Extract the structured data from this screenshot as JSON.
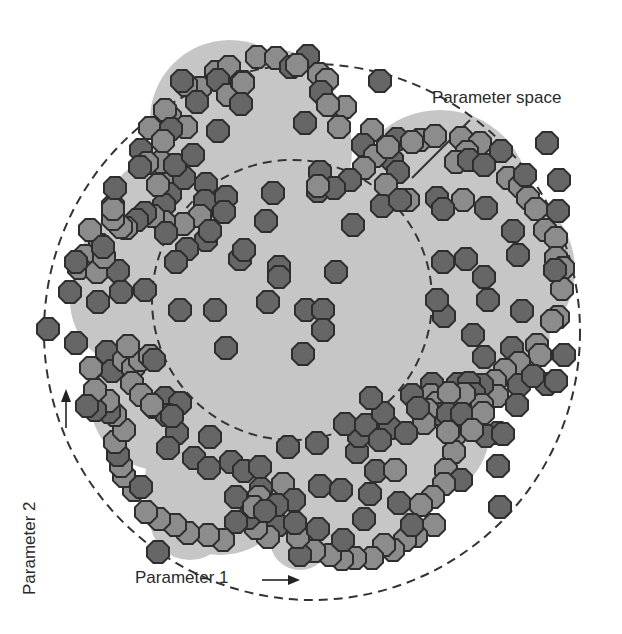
{
  "labels": {
    "parameter_space": "Parameter space",
    "parameter_1": "Parameter 1",
    "parameter_2": "Parameter 2"
  },
  "colors": {
    "background": "#ffffff",
    "region_fill": "#c6c6c6",
    "dot_dark": "#666666",
    "dot_light": "#8c8c8c",
    "dot_stroke": "#2e2e2e",
    "dashed_line": "#333333"
  },
  "outer_circle": {
    "cx": 312,
    "cy": 332,
    "r": 268
  },
  "inner_circle": {
    "cx": 292,
    "cy": 300,
    "r": 140
  },
  "region_lobes": [
    [
      252,
      150,
      100
    ],
    [
      440,
      200,
      90
    ],
    [
      490,
      270,
      85
    ],
    [
      470,
      330,
      80
    ],
    [
      180,
      230,
      80
    ],
    [
      140,
      300,
      70
    ],
    [
      160,
      400,
      70
    ],
    [
      220,
      480,
      75
    ],
    [
      330,
      470,
      90
    ],
    [
      420,
      430,
      70
    ],
    [
      292,
      300,
      145
    ],
    [
      230,
      120,
      80
    ],
    [
      280,
      95,
      45
    ],
    [
      350,
      440,
      80
    ],
    [
      120,
      270,
      45
    ],
    [
      190,
      520,
      40
    ],
    [
      300,
      540,
      30
    ],
    [
      380,
      520,
      35
    ]
  ],
  "dots": [
    {
      "x": 216,
      "y": 72,
      "t": "l"
    },
    {
      "x": 229,
      "y": 67,
      "t": "l"
    },
    {
      "x": 257,
      "y": 57,
      "t": "l"
    },
    {
      "x": 276,
      "y": 58,
      "t": "l"
    },
    {
      "x": 291,
      "y": 67,
      "t": "d"
    },
    {
      "x": 308,
      "y": 56,
      "t": "d"
    },
    {
      "x": 297,
      "y": 65,
      "t": "l"
    },
    {
      "x": 319,
      "y": 74,
      "t": "l"
    },
    {
      "x": 327,
      "y": 80,
      "t": "l"
    },
    {
      "x": 200,
      "y": 88,
      "t": "l"
    },
    {
      "x": 218,
      "y": 80,
      "t": "d"
    },
    {
      "x": 228,
      "y": 95,
      "t": "l"
    },
    {
      "x": 243,
      "y": 82,
      "t": "l"
    },
    {
      "x": 186,
      "y": 85,
      "t": "l"
    },
    {
      "x": 197,
      "y": 102,
      "t": "d"
    },
    {
      "x": 242,
      "y": 82,
      "t": "d"
    },
    {
      "x": 321,
      "y": 92,
      "t": "d"
    },
    {
      "x": 380,
      "y": 81,
      "t": "d"
    },
    {
      "x": 157,
      "y": 128,
      "t": "d"
    },
    {
      "x": 170,
      "y": 117,
      "t": "l"
    },
    {
      "x": 182,
      "y": 81,
      "t": "d"
    },
    {
      "x": 186,
      "y": 127,
      "t": "l"
    },
    {
      "x": 218,
      "y": 131,
      "t": "d"
    },
    {
      "x": 243,
      "y": 83,
      "t": "l"
    },
    {
      "x": 305,
      "y": 123,
      "t": "d"
    },
    {
      "x": 345,
      "y": 107,
      "t": "l"
    },
    {
      "x": 328,
      "y": 105,
      "t": "l"
    },
    {
      "x": 339,
      "y": 127,
      "t": "l"
    },
    {
      "x": 165,
      "y": 110,
      "t": "l"
    },
    {
      "x": 150,
      "y": 128,
      "t": "l"
    },
    {
      "x": 241,
      "y": 104,
      "t": "d"
    },
    {
      "x": 372,
      "y": 130,
      "t": "l"
    },
    {
      "x": 397,
      "y": 139,
      "t": "d"
    },
    {
      "x": 420,
      "y": 140,
      "t": "l"
    },
    {
      "x": 435,
      "y": 136,
      "t": "l"
    },
    {
      "x": 392,
      "y": 160,
      "t": "d"
    },
    {
      "x": 398,
      "y": 172,
      "t": "d"
    },
    {
      "x": 363,
      "y": 145,
      "t": "d"
    },
    {
      "x": 375,
      "y": 156,
      "t": "l"
    },
    {
      "x": 388,
      "y": 147,
      "t": "l"
    },
    {
      "x": 412,
      "y": 142,
      "t": "l"
    },
    {
      "x": 461,
      "y": 138,
      "t": "l"
    },
    {
      "x": 480,
      "y": 143,
      "t": "l"
    },
    {
      "x": 501,
      "y": 151,
      "t": "d"
    },
    {
      "x": 547,
      "y": 143,
      "t": "d"
    },
    {
      "x": 467,
      "y": 152,
      "t": "l"
    },
    {
      "x": 456,
      "y": 162,
      "t": "l"
    },
    {
      "x": 469,
      "y": 160,
      "t": "d"
    },
    {
      "x": 484,
      "y": 165,
      "t": "d"
    },
    {
      "x": 386,
      "y": 185,
      "t": "l"
    },
    {
      "x": 364,
      "y": 168,
      "t": "l"
    },
    {
      "x": 320,
      "y": 172,
      "t": "d"
    },
    {
      "x": 350,
      "y": 180,
      "t": "d"
    },
    {
      "x": 408,
      "y": 200,
      "t": "l"
    },
    {
      "x": 437,
      "y": 198,
      "t": "d"
    },
    {
      "x": 508,
      "y": 178,
      "t": "l"
    },
    {
      "x": 520,
      "y": 186,
      "t": "l"
    },
    {
      "x": 525,
      "y": 175,
      "t": "d"
    },
    {
      "x": 559,
      "y": 180,
      "t": "d"
    },
    {
      "x": 528,
      "y": 198,
      "t": "l"
    },
    {
      "x": 536,
      "y": 209,
      "t": "l"
    },
    {
      "x": 545,
      "y": 230,
      "t": "l"
    },
    {
      "x": 558,
      "y": 211,
      "t": "d"
    },
    {
      "x": 556,
      "y": 238,
      "t": "l"
    },
    {
      "x": 486,
      "y": 208,
      "t": "d"
    },
    {
      "x": 463,
      "y": 200,
      "t": "l"
    },
    {
      "x": 443,
      "y": 209,
      "t": "d"
    },
    {
      "x": 513,
      "y": 231,
      "t": "d"
    },
    {
      "x": 556,
      "y": 258,
      "t": "l"
    },
    {
      "x": 563,
      "y": 268,
      "t": "l"
    },
    {
      "x": 562,
      "y": 289,
      "t": "l"
    },
    {
      "x": 555,
      "y": 270,
      "t": "d"
    },
    {
      "x": 466,
      "y": 259,
      "t": "d"
    },
    {
      "x": 518,
      "y": 255,
      "t": "d"
    },
    {
      "x": 484,
      "y": 277,
      "t": "d"
    },
    {
      "x": 443,
      "y": 262,
      "t": "d"
    },
    {
      "x": 522,
      "y": 311,
      "t": "d"
    },
    {
      "x": 558,
      "y": 317,
      "t": "l"
    },
    {
      "x": 552,
      "y": 321,
      "t": "l"
    },
    {
      "x": 488,
      "y": 300,
      "t": "d"
    },
    {
      "x": 444,
      "y": 316,
      "t": "d"
    },
    {
      "x": 473,
      "y": 335,
      "t": "d"
    },
    {
      "x": 537,
      "y": 345,
      "t": "l"
    },
    {
      "x": 540,
      "y": 355,
      "t": "l"
    },
    {
      "x": 512,
      "y": 348,
      "t": "d"
    },
    {
      "x": 564,
      "y": 355,
      "t": "d"
    },
    {
      "x": 519,
      "y": 363,
      "t": "l"
    },
    {
      "x": 505,
      "y": 370,
      "t": "l"
    },
    {
      "x": 495,
      "y": 381,
      "t": "l"
    },
    {
      "x": 519,
      "y": 385,
      "t": "d"
    },
    {
      "x": 497,
      "y": 396,
      "t": "l"
    },
    {
      "x": 482,
      "y": 385,
      "t": "d"
    },
    {
      "x": 458,
      "y": 384,
      "t": "d"
    },
    {
      "x": 432,
      "y": 384,
      "t": "d"
    },
    {
      "x": 431,
      "y": 395,
      "t": "l"
    },
    {
      "x": 437,
      "y": 403,
      "t": "l"
    },
    {
      "x": 469,
      "y": 383,
      "t": "d"
    },
    {
      "x": 474,
      "y": 394,
      "t": "d"
    },
    {
      "x": 482,
      "y": 405,
      "t": "l"
    },
    {
      "x": 464,
      "y": 394,
      "t": "l"
    },
    {
      "x": 449,
      "y": 393,
      "t": "l"
    },
    {
      "x": 437,
      "y": 414,
      "t": "d"
    },
    {
      "x": 412,
      "y": 395,
      "t": "d"
    },
    {
      "x": 427,
      "y": 410,
      "t": "l"
    },
    {
      "x": 424,
      "y": 423,
      "t": "l"
    },
    {
      "x": 448,
      "y": 414,
      "t": "d"
    },
    {
      "x": 462,
      "y": 414,
      "t": "d"
    },
    {
      "x": 483,
      "y": 413,
      "t": "l"
    },
    {
      "x": 498,
      "y": 433,
      "t": "d"
    },
    {
      "x": 486,
      "y": 436,
      "t": "d"
    },
    {
      "x": 503,
      "y": 434,
      "t": "d"
    },
    {
      "x": 517,
      "y": 405,
      "t": "d"
    },
    {
      "x": 547,
      "y": 384,
      "t": "d"
    },
    {
      "x": 556,
      "y": 381,
      "t": "d"
    },
    {
      "x": 533,
      "y": 376,
      "t": "d"
    },
    {
      "x": 454,
      "y": 436,
      "t": "l"
    },
    {
      "x": 454,
      "y": 452,
      "t": "l"
    },
    {
      "x": 446,
      "y": 470,
      "t": "l"
    },
    {
      "x": 461,
      "y": 480,
      "t": "d"
    },
    {
      "x": 444,
      "y": 484,
      "t": "l"
    },
    {
      "x": 433,
      "y": 497,
      "t": "l"
    },
    {
      "x": 421,
      "y": 505,
      "t": "l"
    },
    {
      "x": 498,
      "y": 466,
      "t": "d"
    },
    {
      "x": 500,
      "y": 507,
      "t": "d"
    },
    {
      "x": 434,
      "y": 525,
      "t": "l"
    },
    {
      "x": 416,
      "y": 536,
      "t": "l"
    },
    {
      "x": 405,
      "y": 540,
      "t": "l"
    },
    {
      "x": 393,
      "y": 550,
      "t": "l"
    },
    {
      "x": 384,
      "y": 545,
      "t": "l"
    },
    {
      "x": 372,
      "y": 558,
      "t": "l"
    },
    {
      "x": 355,
      "y": 558,
      "t": "l"
    },
    {
      "x": 342,
      "y": 559,
      "t": "l"
    },
    {
      "x": 330,
      "y": 555,
      "t": "l"
    },
    {
      "x": 314,
      "y": 551,
      "t": "l"
    },
    {
      "x": 300,
      "y": 555,
      "t": "d"
    },
    {
      "x": 298,
      "y": 537,
      "t": "l"
    },
    {
      "x": 343,
      "y": 540,
      "t": "d"
    },
    {
      "x": 364,
      "y": 519,
      "t": "d"
    },
    {
      "x": 318,
      "y": 529,
      "t": "d"
    },
    {
      "x": 278,
      "y": 525,
      "t": "d"
    },
    {
      "x": 268,
      "y": 537,
      "t": "l"
    },
    {
      "x": 256,
      "y": 528,
      "t": "l"
    },
    {
      "x": 248,
      "y": 518,
      "t": "d"
    },
    {
      "x": 236,
      "y": 522,
      "t": "d"
    },
    {
      "x": 223,
      "y": 540,
      "t": "l"
    },
    {
      "x": 208,
      "y": 535,
      "t": "l"
    },
    {
      "x": 188,
      "y": 533,
      "t": "l"
    },
    {
      "x": 175,
      "y": 525,
      "t": "l"
    },
    {
      "x": 159,
      "y": 519,
      "t": "l"
    },
    {
      "x": 146,
      "y": 512,
      "t": "l"
    },
    {
      "x": 134,
      "y": 490,
      "t": "l"
    },
    {
      "x": 124,
      "y": 476,
      "t": "l"
    },
    {
      "x": 121,
      "y": 466,
      "t": "l"
    },
    {
      "x": 118,
      "y": 455,
      "t": "d"
    },
    {
      "x": 115,
      "y": 442,
      "t": "l"
    },
    {
      "x": 124,
      "y": 430,
      "t": "l"
    },
    {
      "x": 115,
      "y": 415,
      "t": "l"
    },
    {
      "x": 109,
      "y": 412,
      "t": "d"
    },
    {
      "x": 108,
      "y": 401,
      "t": "l"
    },
    {
      "x": 95,
      "y": 410,
      "t": "d"
    },
    {
      "x": 95,
      "y": 390,
      "t": "l"
    },
    {
      "x": 92,
      "y": 368,
      "t": "l"
    },
    {
      "x": 107,
      "y": 352,
      "t": "d"
    },
    {
      "x": 112,
      "y": 371,
      "t": "d"
    },
    {
      "x": 124,
      "y": 360,
      "t": "l"
    },
    {
      "x": 133,
      "y": 368,
      "t": "l"
    },
    {
      "x": 140,
      "y": 360,
      "t": "l"
    },
    {
      "x": 150,
      "y": 356,
      "t": "l"
    },
    {
      "x": 154,
      "y": 360,
      "t": "d"
    },
    {
      "x": 128,
      "y": 346,
      "t": "l"
    },
    {
      "x": 132,
      "y": 383,
      "t": "l"
    },
    {
      "x": 141,
      "y": 395,
      "t": "l"
    },
    {
      "x": 154,
      "y": 407,
      "t": "l"
    },
    {
      "x": 165,
      "y": 398,
      "t": "d"
    },
    {
      "x": 180,
      "y": 403,
      "t": "d"
    },
    {
      "x": 167,
      "y": 415,
      "t": "d"
    },
    {
      "x": 177,
      "y": 433,
      "t": "d"
    },
    {
      "x": 168,
      "y": 448,
      "t": "d"
    },
    {
      "x": 141,
      "y": 487,
      "t": "d"
    },
    {
      "x": 158,
      "y": 552,
      "t": "d"
    },
    {
      "x": 210,
      "y": 437,
      "t": "d"
    },
    {
      "x": 194,
      "y": 458,
      "t": "d"
    },
    {
      "x": 209,
      "y": 468,
      "t": "d"
    },
    {
      "x": 231,
      "y": 462,
      "t": "d"
    },
    {
      "x": 244,
      "y": 471,
      "t": "d"
    },
    {
      "x": 260,
      "y": 467,
      "t": "d"
    },
    {
      "x": 261,
      "y": 489,
      "t": "d"
    },
    {
      "x": 236,
      "y": 497,
      "t": "d"
    },
    {
      "x": 259,
      "y": 497,
      "t": "l"
    },
    {
      "x": 283,
      "y": 484,
      "t": "l"
    },
    {
      "x": 294,
      "y": 500,
      "t": "d"
    },
    {
      "x": 277,
      "y": 505,
      "t": "d"
    },
    {
      "x": 254,
      "y": 507,
      "t": "l"
    },
    {
      "x": 265,
      "y": 511,
      "t": "d"
    },
    {
      "x": 295,
      "y": 523,
      "t": "d"
    },
    {
      "x": 320,
      "y": 486,
      "t": "d"
    },
    {
      "x": 341,
      "y": 490,
      "t": "d"
    },
    {
      "x": 370,
      "y": 494,
      "t": "d"
    },
    {
      "x": 357,
      "y": 452,
      "t": "d"
    },
    {
      "x": 376,
      "y": 471,
      "t": "d"
    },
    {
      "x": 399,
      "y": 503,
      "t": "d"
    },
    {
      "x": 412,
      "y": 525,
      "t": "d"
    },
    {
      "x": 390,
      "y": 428,
      "t": "d"
    },
    {
      "x": 406,
      "y": 433,
      "t": "d"
    },
    {
      "x": 418,
      "y": 408,
      "t": "d"
    },
    {
      "x": 448,
      "y": 432,
      "t": "l"
    },
    {
      "x": 472,
      "y": 430,
      "t": "l"
    },
    {
      "x": 359,
      "y": 436,
      "t": "d"
    },
    {
      "x": 288,
      "y": 447,
      "t": "d"
    },
    {
      "x": 317,
      "y": 443,
      "t": "d"
    },
    {
      "x": 345,
      "y": 424,
      "t": "d"
    },
    {
      "x": 366,
      "y": 425,
      "t": "d"
    },
    {
      "x": 395,
      "y": 470,
      "t": "l"
    },
    {
      "x": 380,
      "y": 440,
      "t": "d"
    },
    {
      "x": 164,
      "y": 181,
      "t": "l"
    },
    {
      "x": 170,
      "y": 194,
      "t": "d"
    },
    {
      "x": 164,
      "y": 205,
      "t": "d"
    },
    {
      "x": 184,
      "y": 178,
      "t": "d"
    },
    {
      "x": 206,
      "y": 184,
      "t": "d"
    },
    {
      "x": 205,
      "y": 201,
      "t": "d"
    },
    {
      "x": 200,
      "y": 216,
      "t": "l"
    },
    {
      "x": 183,
      "y": 224,
      "t": "l"
    },
    {
      "x": 164,
      "y": 222,
      "t": "l"
    },
    {
      "x": 153,
      "y": 216,
      "t": "l"
    },
    {
      "x": 145,
      "y": 213,
      "t": "d"
    },
    {
      "x": 166,
      "y": 233,
      "t": "d"
    },
    {
      "x": 206,
      "y": 240,
      "t": "d"
    },
    {
      "x": 187,
      "y": 249,
      "t": "d"
    },
    {
      "x": 176,
      "y": 262,
      "t": "d"
    },
    {
      "x": 137,
      "y": 220,
      "t": "d"
    },
    {
      "x": 126,
      "y": 228,
      "t": "l"
    },
    {
      "x": 121,
      "y": 227,
      "t": "l"
    },
    {
      "x": 113,
      "y": 219,
      "t": "l"
    },
    {
      "x": 100,
      "y": 245,
      "t": "l"
    },
    {
      "x": 102,
      "y": 256,
      "t": "l"
    },
    {
      "x": 85,
      "y": 256,
      "t": "l"
    },
    {
      "x": 79,
      "y": 268,
      "t": "l"
    },
    {
      "x": 97,
      "y": 272,
      "t": "l"
    },
    {
      "x": 118,
      "y": 271,
      "t": "d"
    },
    {
      "x": 98,
      "y": 302,
      "t": "d"
    },
    {
      "x": 121,
      "y": 292,
      "t": "d"
    },
    {
      "x": 145,
      "y": 290,
      "t": "d"
    },
    {
      "x": 70,
      "y": 292,
      "t": "d"
    },
    {
      "x": 48,
      "y": 329,
      "t": "d"
    },
    {
      "x": 76,
      "y": 343,
      "t": "d"
    },
    {
      "x": 91,
      "y": 368,
      "t": "l"
    },
    {
      "x": 87,
      "y": 406,
      "t": "d"
    },
    {
      "x": 113,
      "y": 206,
      "t": "d"
    },
    {
      "x": 104,
      "y": 257,
      "t": "l"
    },
    {
      "x": 90,
      "y": 230,
      "t": "l"
    },
    {
      "x": 103,
      "y": 247,
      "t": "d"
    },
    {
      "x": 76,
      "y": 262,
      "t": "d"
    },
    {
      "x": 113,
      "y": 209,
      "t": "l"
    },
    {
      "x": 115,
      "y": 188,
      "t": "d"
    },
    {
      "x": 161,
      "y": 162,
      "t": "l"
    },
    {
      "x": 175,
      "y": 165,
      "t": "d"
    },
    {
      "x": 193,
      "y": 155,
      "t": "d"
    },
    {
      "x": 226,
      "y": 197,
      "t": "d"
    },
    {
      "x": 210,
      "y": 231,
      "t": "d"
    },
    {
      "x": 224,
      "y": 212,
      "t": "d"
    },
    {
      "x": 266,
      "y": 221,
      "t": "d"
    },
    {
      "x": 273,
      "y": 193,
      "t": "d"
    },
    {
      "x": 240,
      "y": 259,
      "t": "d"
    },
    {
      "x": 171,
      "y": 129,
      "t": "d"
    },
    {
      "x": 141,
      "y": 150,
      "t": "d"
    },
    {
      "x": 147,
      "y": 163,
      "t": "l"
    },
    {
      "x": 163,
      "y": 141,
      "t": "l"
    },
    {
      "x": 140,
      "y": 167,
      "t": "d"
    },
    {
      "x": 158,
      "y": 185,
      "t": "l"
    },
    {
      "x": 279,
      "y": 267,
      "t": "d"
    },
    {
      "x": 279,
      "y": 277,
      "t": "d"
    },
    {
      "x": 336,
      "y": 272,
      "t": "d"
    },
    {
      "x": 268,
      "y": 302,
      "t": "d"
    },
    {
      "x": 306,
      "y": 310,
      "t": "d"
    },
    {
      "x": 323,
      "y": 310,
      "t": "d"
    },
    {
      "x": 323,
      "y": 330,
      "t": "d"
    },
    {
      "x": 303,
      "y": 354,
      "t": "d"
    },
    {
      "x": 226,
      "y": 348,
      "t": "d"
    },
    {
      "x": 180,
      "y": 310,
      "t": "d"
    },
    {
      "x": 215,
      "y": 310,
      "t": "d"
    },
    {
      "x": 353,
      "y": 225,
      "t": "d"
    },
    {
      "x": 318,
      "y": 191,
      "t": "d"
    },
    {
      "x": 334,
      "y": 188,
      "t": "d"
    },
    {
      "x": 318,
      "y": 186,
      "t": "l"
    },
    {
      "x": 382,
      "y": 206,
      "t": "d"
    },
    {
      "x": 400,
      "y": 200,
      "t": "d"
    },
    {
      "x": 383,
      "y": 413,
      "t": "d"
    },
    {
      "x": 371,
      "y": 398,
      "t": "d"
    },
    {
      "x": 172,
      "y": 416,
      "t": "d"
    },
    {
      "x": 152,
      "y": 405,
      "t": "l"
    },
    {
      "x": 244,
      "y": 250,
      "t": "d"
    },
    {
      "x": 437,
      "y": 300,
      "t": "d"
    },
    {
      "x": 484,
      "y": 357,
      "t": "d"
    }
  ]
}
